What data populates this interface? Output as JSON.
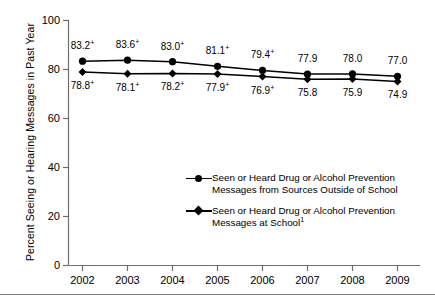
{
  "chart_data": {
    "type": "line",
    "title": "",
    "xlabel": "",
    "ylabel": "Percent Seeing or Hearing Messages in Past Year",
    "categories": [
      "2002",
      "2003",
      "2004",
      "2005",
      "2006",
      "2007",
      "2008",
      "2009"
    ],
    "ylim": [
      0,
      100
    ],
    "yticks": [
      "0",
      "20",
      "40",
      "60",
      "80",
      "100"
    ],
    "grid": false,
    "legend_position": "center",
    "series": [
      {
        "name": "Seen or Heard Drug or Alcohol Prevention\nMessages from Sources Outside of School",
        "marker": "circle",
        "values": [
          83.2,
          83.6,
          83.0,
          81.1,
          79.4,
          77.9,
          78.0,
          77.0
        ],
        "labels": [
          "83.2",
          "83.6",
          "83.0",
          "81.1",
          "79.4",
          "77.9",
          "78.0",
          "77.0"
        ],
        "label_marks": [
          "+",
          "+",
          "+",
          "+",
          "+",
          "",
          "",
          ""
        ],
        "label_position": "above"
      },
      {
        "name": "Seen or Heard Drug or Alcohol Prevention\nMessages at School",
        "name_superscript": "1",
        "marker": "diamond",
        "values": [
          78.8,
          78.1,
          78.2,
          77.9,
          76.9,
          75.8,
          75.9,
          74.9
        ],
        "labels": [
          "78.8",
          "78.1",
          "78.2",
          "77.9",
          "76.9",
          "75.8",
          "75.9",
          "74.9"
        ],
        "label_marks": [
          "+",
          "+",
          "+",
          "+",
          "+",
          "",
          "",
          ""
        ],
        "label_position": "below"
      }
    ]
  },
  "colors": {
    "line": "#000000",
    "axis": "#6e6e6e",
    "rule": "#808080",
    "background": "#ffffff"
  }
}
